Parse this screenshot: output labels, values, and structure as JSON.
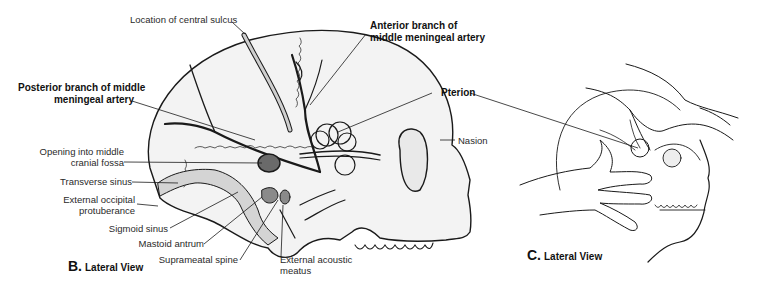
{
  "figure": {
    "panel_b": {
      "caption_letter": "B.",
      "caption_text": "Lateral View",
      "labels": {
        "central_sulcus": "Location of central sulcus",
        "anterior_branch_1": "Anterior branch of",
        "anterior_branch_2": "middle meningeal artery",
        "posterior_branch_1": "Posterior branch of middle",
        "posterior_branch_2": "meningeal artery",
        "pterion": "Pterion",
        "nasion": "Nasion",
        "opening_1": "Opening into middle",
        "opening_2": "cranial fossa",
        "transverse_sinus": "Transverse sinus",
        "ext_occipital_1": "External occipital",
        "ext_occipital_2": "protuberance",
        "sigmoid_sinus": "Sigmoid sinus",
        "mastoid_antrum": "Mastoid antrum",
        "suprameatal_spine": "Suprameatal spine",
        "ext_acoustic_1": "External acoustic",
        "ext_acoustic_2": "meatus"
      }
    },
    "panel_c": {
      "caption_letter": "C.",
      "caption_text": "Lateral View"
    },
    "colors": {
      "line": "#1a1a1a",
      "bone_fill": "#f1f1f1",
      "sinus_fill": "#d4d4d4",
      "dark_fill": "#6a6a6a"
    }
  }
}
